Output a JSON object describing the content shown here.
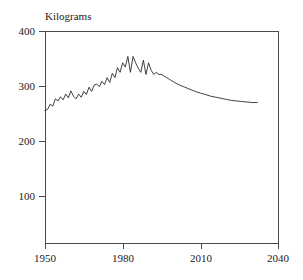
{
  "chart_data": {
    "type": "line",
    "title": "",
    "subtitle": "",
    "xlabel": "",
    "ylabel": "Kilograms",
    "ylabel_position": "above-axis-top-left",
    "xlim": [
      1950,
      2040
    ],
    "ylim": [
      0,
      400
    ],
    "grid": false,
    "legend": null,
    "xticks": [
      1950,
      1980,
      2010,
      2040
    ],
    "xtick_labels": [
      "1950",
      "1980",
      "2010",
      "2040"
    ],
    "yticks": [
      100,
      200,
      300,
      400
    ],
    "ytick_labels": [
      "100",
      "200",
      "300",
      "400"
    ],
    "line_color": "#2b2b2b",
    "series": [
      {
        "name": "Kilograms",
        "x": [
          1950,
          1951,
          1952,
          1953,
          1954,
          1955,
          1956,
          1957,
          1958,
          1959,
          1960,
          1961,
          1962,
          1963,
          1964,
          1965,
          1966,
          1967,
          1968,
          1969,
          1970,
          1971,
          1972,
          1973,
          1974,
          1975,
          1976,
          1977,
          1978,
          1979,
          1980,
          1981,
          1982,
          1983,
          1984,
          1985,
          1986,
          1987,
          1988,
          1989,
          1990,
          1991,
          1992,
          1993,
          1994,
          1995,
          1996,
          1997,
          1998,
          1999,
          2000,
          2002,
          2004,
          2006,
          2008,
          2010,
          2012,
          2014,
          2016,
          2018,
          2020,
          2022,
          2024,
          2026,
          2028,
          2030,
          2032
        ],
        "values": [
          250,
          252,
          262,
          258,
          272,
          268,
          276,
          270,
          281,
          274,
          287,
          277,
          272,
          281,
          275,
          286,
          280,
          294,
          286,
          298,
          300,
          295,
          305,
          299,
          312,
          303,
          320,
          312,
          331,
          322,
          340,
          332,
          352,
          322,
          352,
          340,
          330,
          322,
          345,
          318,
          340,
          326,
          318,
          322,
          318,
          318,
          315,
          312,
          309,
          306,
          303,
          298,
          294,
          290,
          286,
          283,
          280,
          277,
          275,
          273,
          271,
          269,
          268,
          267,
          266,
          265,
          265
        ]
      }
    ],
    "annotations": []
  },
  "axis": {
    "y_axis_title": "Kilograms"
  }
}
